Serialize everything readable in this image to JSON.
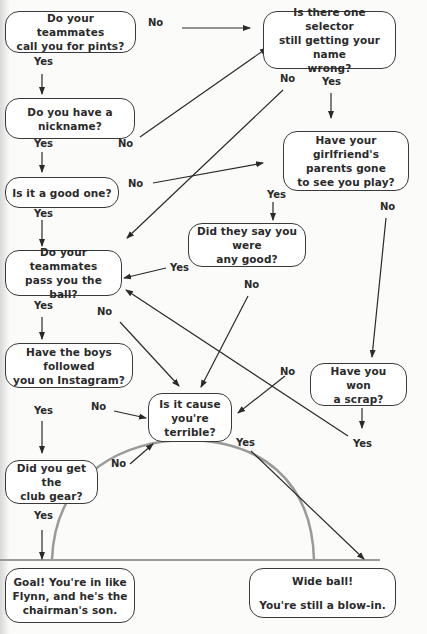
{
  "nodes": {
    "pints": "Do your teammates\ncall you for pints?",
    "selector": "Is there one selector\nstill getting your name\nwrong?",
    "nickname": "Do you have a\nnickname?",
    "girlfriend": "Have your girlfriend's\nparents gone\nto see you play?",
    "good_one": "Is it a good one?",
    "any_good": "Did they say you were\nany good?",
    "pass_ball": "Do your teammates\npass you the ball?",
    "instagram": "Have the boys followed\nyou on Instagram?",
    "scrap": "Have you won\na scrap?",
    "terrible": "Is it cause\nyou're terrible?",
    "club_gear": "Did you get the\nclub gear?",
    "goal": "Goal! You're in like\nFlynn, and he's the\nchairman's son.",
    "wide": "Wide ball!\n\nYou're still a blow-in."
  },
  "labels": {
    "pints_no": "No",
    "pints_yes": "Yes",
    "selector_no": "No",
    "selector_yes": "Yes",
    "nickname_yes": "Yes",
    "nickname_no": "No",
    "good_one_no": "No",
    "good_one_yes": "Yes",
    "girlfriend_yes": "Yes",
    "girlfriend_no": "No",
    "any_good_yes": "Yes",
    "any_good_no": "No",
    "pass_yes": "Yes",
    "pass_no": "No",
    "instagram_yes": "Yes",
    "instagram_no": "No",
    "scrap_no": "No",
    "scrap_yes": "Yes",
    "terrible_yes": "Yes",
    "gear_no": "No",
    "gear_yes": "Yes"
  },
  "colors": {
    "line": "#2a2a2a",
    "pitch_arc": "#9a9a9a",
    "background": "#fbfbfa"
  }
}
